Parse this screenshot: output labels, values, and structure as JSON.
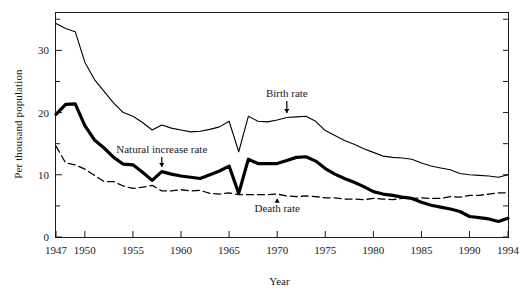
{
  "chart_data": {
    "type": "line",
    "title": "",
    "xlabel": "Year",
    "ylabel": "Per thousand population",
    "xlim": [
      1947,
      1994
    ],
    "ylim": [
      0,
      36
    ],
    "xticks": [
      1947,
      1950,
      1955,
      1960,
      1965,
      1970,
      1975,
      1980,
      1985,
      1990,
      1994
    ],
    "xtick_labels": [
      "1947",
      "1950",
      "1955",
      "1960",
      "1965",
      "1970",
      "1975",
      "1980",
      "1985",
      "1990",
      "1994"
    ],
    "yticks": [
      0,
      10,
      20,
      30
    ],
    "ytick_labels": [
      "0",
      "10",
      "20",
      "30"
    ],
    "yminorticks": [
      5,
      15,
      25,
      35
    ],
    "grid": false,
    "legend_position": "inline-annotations",
    "x": [
      1947,
      1948,
      1949,
      1950,
      1951,
      1952,
      1953,
      1954,
      1955,
      1956,
      1957,
      1958,
      1959,
      1960,
      1961,
      1962,
      1963,
      1964,
      1965,
      1966,
      1967,
      1968,
      1969,
      1970,
      1971,
      1972,
      1973,
      1974,
      1975,
      1976,
      1977,
      1978,
      1979,
      1980,
      1981,
      1982,
      1983,
      1984,
      1985,
      1986,
      1987,
      1988,
      1989,
      1990,
      1991,
      1992,
      1993,
      1994
    ],
    "series": [
      {
        "name": "Birth rate",
        "style": "thin-solid",
        "values": [
          34.3,
          33.5,
          33.0,
          28.1,
          25.3,
          23.4,
          21.5,
          20.0,
          19.4,
          18.4,
          17.2,
          18.0,
          17.5,
          17.2,
          16.9,
          17.0,
          17.3,
          17.7,
          18.6,
          13.7,
          19.4,
          18.6,
          18.5,
          18.8,
          19.2,
          19.3,
          19.4,
          18.6,
          17.1,
          16.3,
          15.5,
          14.9,
          14.2,
          13.6,
          13.0,
          12.8,
          12.7,
          12.5,
          11.9,
          11.4,
          11.1,
          10.8,
          10.2,
          10.0,
          9.9,
          9.8,
          9.6,
          10.0
        ]
      },
      {
        "name": "Natural increase rate",
        "style": "thick-solid",
        "values": [
          19.7,
          21.3,
          21.4,
          17.9,
          15.6,
          14.3,
          12.8,
          11.7,
          11.6,
          10.4,
          9.1,
          10.5,
          10.1,
          9.8,
          9.6,
          9.4,
          10.0,
          10.6,
          11.4,
          7.0,
          12.5,
          11.8,
          11.8,
          11.8,
          12.3,
          12.8,
          12.9,
          12.2,
          11.0,
          10.1,
          9.4,
          8.8,
          8.1,
          7.3,
          6.9,
          6.7,
          6.4,
          6.2,
          5.6,
          5.1,
          4.8,
          4.5,
          4.1,
          3.3,
          3.1,
          2.9,
          2.5,
          3.0
        ]
      },
      {
        "name": "Death rate",
        "style": "dashed",
        "values": [
          14.6,
          11.9,
          11.6,
          10.9,
          9.9,
          8.9,
          8.9,
          8.2,
          7.8,
          8.0,
          8.3,
          7.4,
          7.4,
          7.6,
          7.4,
          7.5,
          7.0,
          6.9,
          7.1,
          6.8,
          6.8,
          6.8,
          6.8,
          6.9,
          6.6,
          6.5,
          6.6,
          6.5,
          6.3,
          6.3,
          6.1,
          6.1,
          6.0,
          6.2,
          6.1,
          6.0,
          6.2,
          6.2,
          6.3,
          6.2,
          6.2,
          6.5,
          6.4,
          6.7,
          6.7,
          6.9,
          7.1,
          7.1
        ]
      }
    ],
    "annotations": [
      {
        "text": "Birth rate",
        "x": 1971,
        "y": 22.5,
        "arrow": "down",
        "arrow_target_y": 19.3
      },
      {
        "text": "Natural increase rate",
        "x": 1958,
        "y": 13.5,
        "arrow": "down",
        "arrow_target_y": 10.6
      },
      {
        "text": "Death rate",
        "x": 1970,
        "y": 4.0,
        "arrow": "up",
        "arrow_target_y": 6.8
      }
    ]
  }
}
